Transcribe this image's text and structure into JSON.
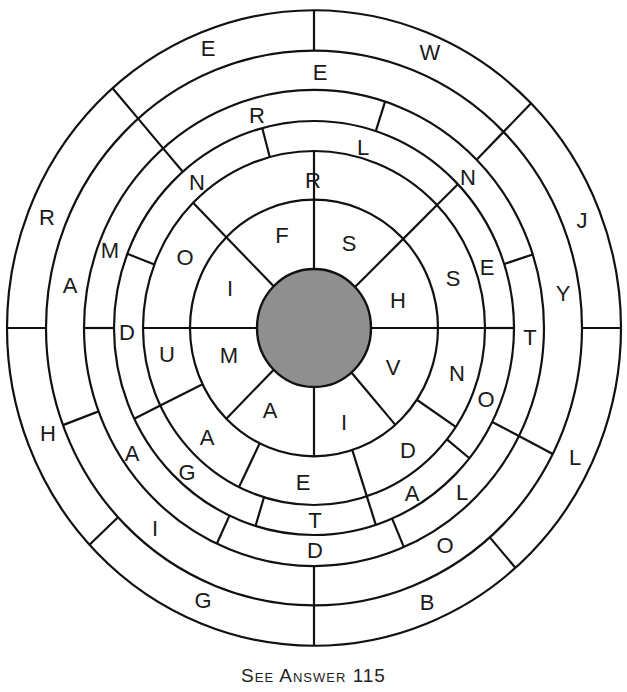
{
  "puzzle": {
    "center": {
      "x": 314,
      "y": 328
    },
    "y_scale": 1.035,
    "hub_color": "#8f8f8f",
    "line_color": "#111111",
    "ring_radii": [
      57,
      124,
      171,
      200,
      230,
      268,
      307
    ],
    "separators": [
      {
        "ring": 1,
        "angles": [
          0,
          44,
          90,
          135,
          180,
          225,
          270,
          311
        ]
      },
      {
        "ring": 2,
        "angles": [
          0,
          44,
          90,
          135,
          180,
          206,
          244,
          288,
          326
        ]
      },
      {
        "ring": 3,
        "angles": [
          0,
          44,
          105,
          159,
          206,
          253,
          288,
          321
        ]
      },
      {
        "ring": 4,
        "angles": [
          18,
          72,
          131,
          180,
          245,
          293,
          333
        ]
      },
      {
        "ring": 5,
        "angles": [
          45,
          131,
          200.5,
          270,
          333
        ]
      },
      {
        "ring": 6,
        "angles": [
          0,
          45,
          90,
          131,
          180,
          223,
          270,
          311
        ]
      }
    ],
    "rings": [
      {
        "ring": 1,
        "letters": [
          {
            "ch": "F",
            "x": 282,
            "y": 235
          },
          {
            "ch": "S",
            "x": 349,
            "y": 243
          },
          {
            "ch": "H",
            "x": 398,
            "y": 300
          },
          {
            "ch": "V",
            "x": 393,
            "y": 367
          },
          {
            "ch": "I",
            "x": 344,
            "y": 422
          },
          {
            "ch": "A",
            "x": 270,
            "y": 410
          },
          {
            "ch": "M",
            "x": 229,
            "y": 355
          },
          {
            "ch": "I",
            "x": 230,
            "y": 288
          }
        ]
      },
      {
        "ring": 2,
        "letters": [
          {
            "ch": "R",
            "x": 313,
            "y": 180
          },
          {
            "ch": "S",
            "x": 453,
            "y": 278
          },
          {
            "ch": "N",
            "x": 457,
            "y": 373
          },
          {
            "ch": "D",
            "x": 408,
            "y": 450
          },
          {
            "ch": "E",
            "x": 303,
            "y": 482
          },
          {
            "ch": "A",
            "x": 207,
            "y": 437
          },
          {
            "ch": "U",
            "x": 167,
            "y": 354
          },
          {
            "ch": "O",
            "x": 185,
            "y": 257
          }
        ]
      },
      {
        "ring": 3,
        "letters": [
          {
            "ch": "L",
            "x": 363,
            "y": 147
          },
          {
            "ch": "N",
            "x": 468,
            "y": 177
          },
          {
            "ch": "E",
            "x": 487,
            "y": 267
          },
          {
            "ch": "O",
            "x": 486,
            "y": 399
          },
          {
            "ch": "A",
            "x": 412,
            "y": 493
          },
          {
            "ch": "T",
            "x": 315,
            "y": 520
          },
          {
            "ch": "G",
            "x": 187,
            "y": 472
          },
          {
            "ch": "D",
            "x": 127,
            "y": 332
          },
          {
            "ch": "N",
            "x": 197,
            "y": 182
          }
        ]
      },
      {
        "ring": 4,
        "letters": [
          {
            "ch": "R",
            "x": 257,
            "y": 115
          },
          {
            "ch": "T",
            "x": 530,
            "y": 337
          },
          {
            "ch": "L",
            "x": 462,
            "y": 492
          },
          {
            "ch": "D",
            "x": 315,
            "y": 550
          },
          {
            "ch": "A",
            "x": 132,
            "y": 453
          },
          {
            "ch": "M",
            "x": 110,
            "y": 250
          }
        ]
      },
      {
        "ring": 5,
        "letters": [
          {
            "ch": "E",
            "x": 320,
            "y": 72
          },
          {
            "ch": "Y",
            "x": 563,
            "y": 293
          },
          {
            "ch": "O",
            "x": 445,
            "y": 545
          },
          {
            "ch": "I",
            "x": 155,
            "y": 528
          },
          {
            "ch": "A",
            "x": 70,
            "y": 285
          }
        ]
      },
      {
        "ring": 6,
        "letters": [
          {
            "ch": "W",
            "x": 430,
            "y": 52
          },
          {
            "ch": "J",
            "x": 582,
            "y": 220
          },
          {
            "ch": "L",
            "x": 575,
            "y": 457
          },
          {
            "ch": "B",
            "x": 427,
            "y": 602
          },
          {
            "ch": "G",
            "x": 203,
            "y": 600
          },
          {
            "ch": "H",
            "x": 48,
            "y": 433
          },
          {
            "ch": "R",
            "x": 47,
            "y": 217
          },
          {
            "ch": "E",
            "x": 208,
            "y": 48
          }
        ]
      }
    ]
  },
  "caption": "See Answer 115"
}
